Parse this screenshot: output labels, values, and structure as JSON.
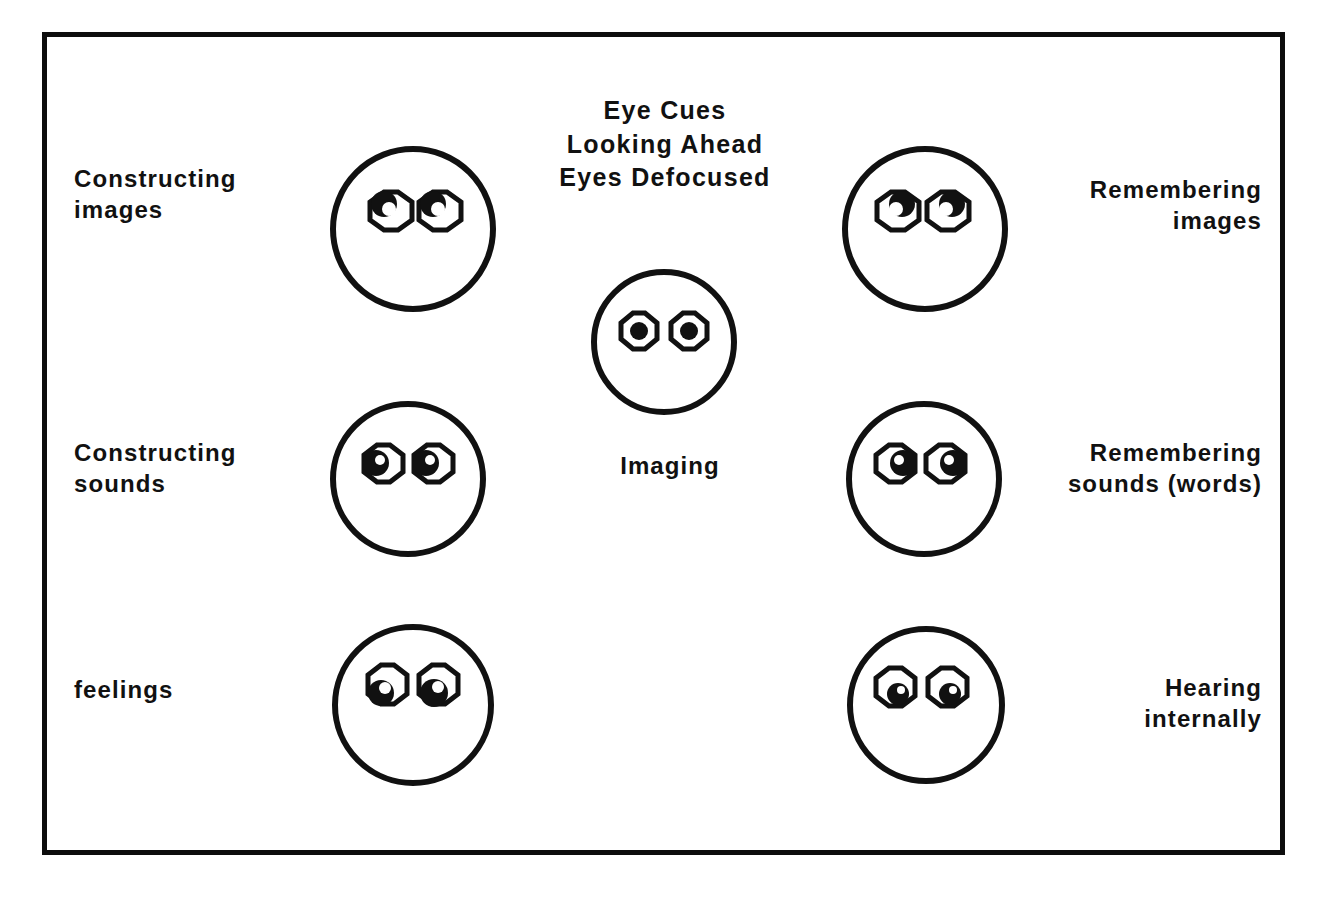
{
  "diagram": {
    "title_lines": "Eye Cues\nLooking Ahead\nEyes Defocused",
    "frame_color": "#0d0d0d",
    "ink_color": "#111111",
    "background": "#ffffff"
  },
  "labels": {
    "constructing_images": "Constructing\nimages",
    "constructing_sounds": "Constructing\nsounds",
    "feelings": "feelings",
    "remembering_images": "Remembering\nimages",
    "remembering_sounds": "Remembering\nsounds (words)",
    "hearing_internally": "Hearing\ninternally",
    "imaging": "Imaging"
  },
  "faces": [
    {
      "id": "face-constructing-images",
      "name": "constructing-images-face",
      "gaze": "up-left",
      "label_ref": "constructing_images"
    },
    {
      "id": "face-remembering-images",
      "name": "remembering-images-face",
      "gaze": "up-right",
      "label_ref": "remembering_images"
    },
    {
      "id": "face-imaging",
      "name": "imaging-face",
      "gaze": "center",
      "label_ref": "imaging"
    },
    {
      "id": "face-constructing-sounds",
      "name": "constructing-sounds-face",
      "gaze": "left",
      "label_ref": "constructing_sounds"
    },
    {
      "id": "face-remembering-sounds",
      "name": "remembering-sounds-face",
      "gaze": "right",
      "label_ref": "remembering_sounds"
    },
    {
      "id": "face-feelings",
      "name": "feelings-face",
      "gaze": "down-left",
      "label_ref": "feelings"
    },
    {
      "id": "face-hearing-internally",
      "name": "hearing-internally-face",
      "gaze": "down-left",
      "label_ref": "hearing_internally"
    }
  ]
}
